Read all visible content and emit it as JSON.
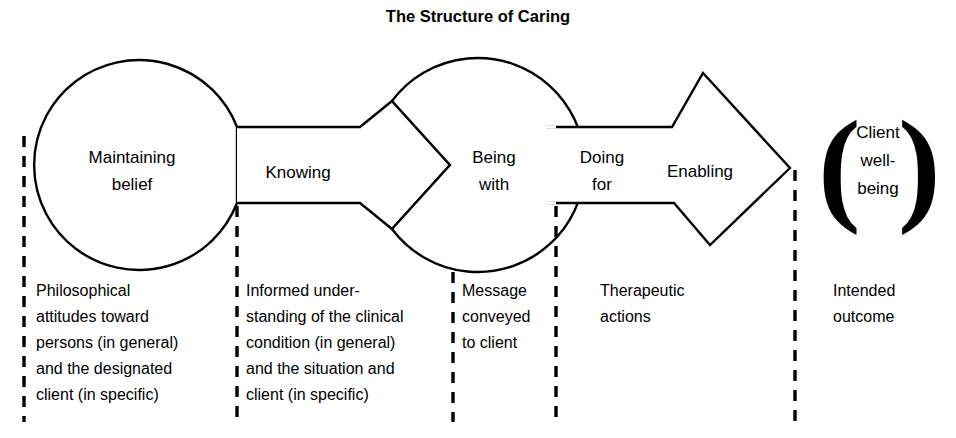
{
  "title": "The Structure of Caring",
  "diagram": {
    "stages": [
      {
        "id": "maintaining-belief",
        "label_line1": "Maintaining",
        "label_line2": "belief",
        "shape": "circle"
      },
      {
        "id": "knowing",
        "label_line1": "Knowing",
        "label_line2": "",
        "shape": "band-chevron"
      },
      {
        "id": "being-with",
        "label_line1": "Being",
        "label_line2": "with",
        "shape": "circle"
      },
      {
        "id": "doing-for",
        "label_line1": "Doing",
        "label_line2": "for",
        "shape": "band"
      },
      {
        "id": "enabling",
        "label_line1": "Enabling",
        "label_line2": "",
        "shape": "arrow-diamond"
      }
    ],
    "outcome": {
      "id": "client-well-being",
      "open_paren": "(",
      "close_paren": ")",
      "label_line1": "Client",
      "label_line2": "well-",
      "label_line3": "being"
    },
    "descriptions": [
      {
        "id": "desc-maintaining-belief",
        "lines": [
          "Philosophical",
          "attitudes toward",
          "persons (in general)",
          "and the designated",
          "client (in specific)"
        ]
      },
      {
        "id": "desc-knowing",
        "lines": [
          "Informed under-",
          "standing of the clinical",
          "condition (in general)",
          "and the situation and",
          "client (in specific)"
        ]
      },
      {
        "id": "desc-being-with",
        "lines": [
          "Message",
          "conveyed",
          "to client"
        ]
      },
      {
        "id": "desc-doing-for-enabling",
        "lines": [
          "Therapeutic",
          "actions"
        ]
      },
      {
        "id": "desc-client-well-being",
        "lines": [
          "Intended",
          "outcome"
        ]
      }
    ],
    "colors": {
      "stroke": "#000000",
      "fill": "#ffffff",
      "text": "#000000"
    }
  }
}
